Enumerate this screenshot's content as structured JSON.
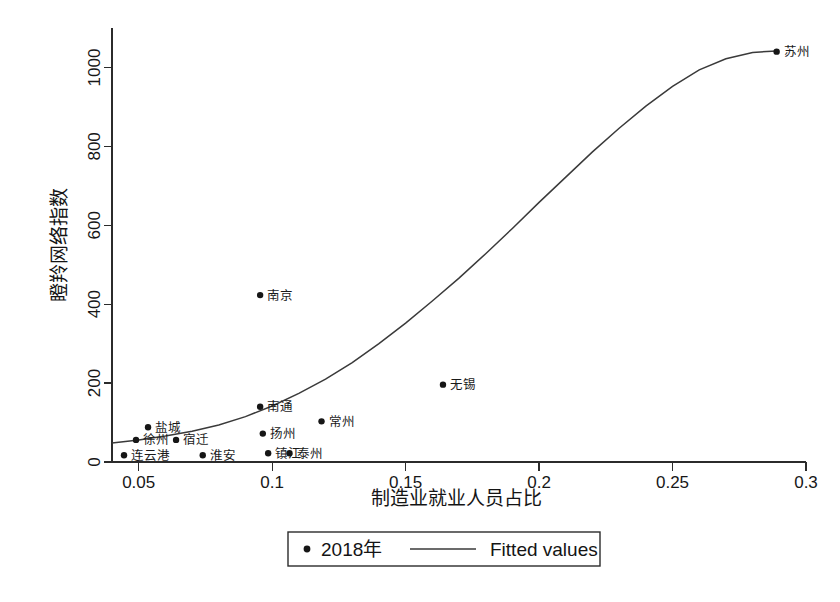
{
  "chart_data": {
    "type": "scatter",
    "title": "",
    "xlabel": "制造业就业人员占比",
    "ylabel": "瞪羚网络指数",
    "xlim": [
      0.04,
      0.3
    ],
    "ylim": [
      0,
      1100
    ],
    "xticks": [
      "0.05",
      "0.1",
      "0.15",
      "0.2",
      "0.25",
      "0.3"
    ],
    "xtick_values": [
      0.05,
      0.1,
      0.15,
      0.2,
      0.25,
      0.3
    ],
    "yticks": [
      "0",
      "200",
      "400",
      "600",
      "800",
      "1000"
    ],
    "ytick_values": [
      0,
      200,
      400,
      600,
      800,
      1000
    ],
    "grid": false,
    "legend_position": "bottom-center",
    "series": [
      {
        "name": "2018年",
        "type": "scatter",
        "marker": "circle",
        "color": "#161616",
        "points": [
          {
            "label": "苏州",
            "x": 0.289,
            "y": 1040,
            "label_side": "right"
          },
          {
            "label": "南京",
            "x": 0.0955,
            "y": 423,
            "label_side": "right"
          },
          {
            "label": "无锡",
            "x": 0.164,
            "y": 196,
            "label_side": "right"
          },
          {
            "label": "南通",
            "x": 0.0955,
            "y": 140,
            "label_side": "right"
          },
          {
            "label": "常州",
            "x": 0.1185,
            "y": 103,
            "label_side": "right"
          },
          {
            "label": "盐城",
            "x": 0.0535,
            "y": 88,
            "label_side": "right"
          },
          {
            "label": "扬州",
            "x": 0.0965,
            "y": 72,
            "label_side": "right"
          },
          {
            "label": "徐州",
            "x": 0.049,
            "y": 56,
            "label_side": "right"
          },
          {
            "label": "宿迁",
            "x": 0.064,
            "y": 56,
            "label_side": "right"
          },
          {
            "label": "镇江",
            "x": 0.0985,
            "y": 22,
            "label_side": "right"
          },
          {
            "label": "泰州",
            "x": 0.1065,
            "y": 22,
            "label_side": "right"
          },
          {
            "label": "连云港",
            "x": 0.0445,
            "y": 17,
            "label_side": "right"
          },
          {
            "label": "淮安",
            "x": 0.074,
            "y": 17,
            "label_side": "right"
          }
        ]
      },
      {
        "name": "Fitted values",
        "type": "line",
        "color": "#3a3a3a",
        "curve": [
          {
            "x": 0.04,
            "y": 48
          },
          {
            "x": 0.05,
            "y": 56
          },
          {
            "x": 0.06,
            "y": 66
          },
          {
            "x": 0.07,
            "y": 78
          },
          {
            "x": 0.08,
            "y": 94
          },
          {
            "x": 0.09,
            "y": 115
          },
          {
            "x": 0.1,
            "y": 142
          },
          {
            "x": 0.11,
            "y": 174
          },
          {
            "x": 0.12,
            "y": 210
          },
          {
            "x": 0.13,
            "y": 252
          },
          {
            "x": 0.14,
            "y": 300
          },
          {
            "x": 0.15,
            "y": 352
          },
          {
            "x": 0.16,
            "y": 408
          },
          {
            "x": 0.17,
            "y": 466
          },
          {
            "x": 0.18,
            "y": 528
          },
          {
            "x": 0.19,
            "y": 592
          },
          {
            "x": 0.2,
            "y": 658
          },
          {
            "x": 0.21,
            "y": 722
          },
          {
            "x": 0.22,
            "y": 786
          },
          {
            "x": 0.23,
            "y": 846
          },
          {
            "x": 0.24,
            "y": 902
          },
          {
            "x": 0.25,
            "y": 952
          },
          {
            "x": 0.26,
            "y": 994
          },
          {
            "x": 0.27,
            "y": 1022
          },
          {
            "x": 0.28,
            "y": 1038
          },
          {
            "x": 0.289,
            "y": 1042
          }
        ]
      }
    ]
  },
  "legend": {
    "scatter_label": "2018年",
    "line_label": "Fitted values"
  }
}
